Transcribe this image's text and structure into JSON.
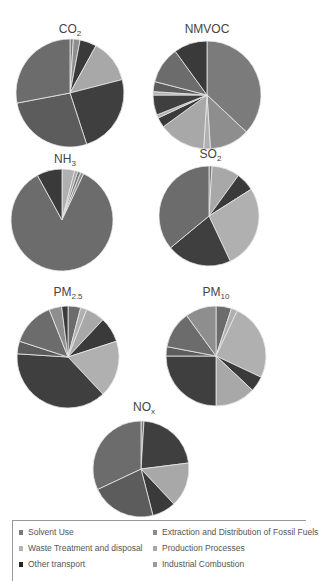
{
  "chart_data": [
    {
      "type": "pie",
      "title": "CO2",
      "title_main": "CO",
      "title_sub": "2",
      "slices": [
        {
          "category": "Solvent Use",
          "value": 1
        },
        {
          "category": "Extraction and Distribution of Fossil Fuels",
          "value": 2
        },
        {
          "category": "Other transport",
          "value": 5
        },
        {
          "category": "Production Processes",
          "value": 13
        },
        {
          "category": "Industrial Combustion",
          "value": 24
        },
        {
          "category": "Road transport",
          "value": 27
        },
        {
          "category": "Energy",
          "value": 28
        }
      ]
    },
    {
      "type": "pie",
      "title": "NMVOC",
      "title_main": "NMVOC",
      "title_sub": "",
      "slices": [
        {
          "category": "Solvent Use",
          "value": 37
        },
        {
          "category": "Extraction and Distribution of Fossil Fuels",
          "value": 12
        },
        {
          "category": "Waste Treatment and disposal",
          "value": 2
        },
        {
          "category": "Production Processes",
          "value": 14
        },
        {
          "category": "Other transport",
          "value": 3
        },
        {
          "category": "Waste Treatment and disposal",
          "value": 1
        },
        {
          "category": "Industrial Combustion",
          "value": 6
        },
        {
          "category": "Waste Treatment and disposal",
          "value": 1
        },
        {
          "category": "Road transport",
          "value": 3
        },
        {
          "category": "Energy",
          "value": 11
        },
        {
          "category": "Other transport",
          "value": 10
        }
      ]
    },
    {
      "type": "pie",
      "title": "NH3",
      "title_main": "NH",
      "title_sub": "3",
      "slices": [
        {
          "category": "Waste Treatment and disposal",
          "value": 4
        },
        {
          "category": "Production Processes",
          "value": 1
        },
        {
          "category": "Solvent Use",
          "value": 1
        },
        {
          "category": "Extraction and Distribution of Fossil Fuels",
          "value": 1
        },
        {
          "category": "Energy",
          "value": 85
        },
        {
          "category": "Other transport",
          "value": 8
        }
      ]
    },
    {
      "type": "pie",
      "title": "SO2",
      "title_main": "SO",
      "title_sub": "2",
      "slices": [
        {
          "category": "Solvent Use",
          "value": 1
        },
        {
          "category": "Production Processes",
          "value": 9
        },
        {
          "category": "Other transport",
          "value": 6
        },
        {
          "category": "Waste Treatment and disposal",
          "value": 27
        },
        {
          "category": "Industrial Combustion",
          "value": 21
        },
        {
          "category": "Energy",
          "value": 36
        }
      ]
    },
    {
      "type": "pie",
      "title": "PM2.5",
      "title_main": "PM",
      "title_sub": "2.5",
      "slices": [
        {
          "category": "Energy",
          "value": 4
        },
        {
          "category": "Waste Treatment and disposal",
          "value": 2
        },
        {
          "category": "Production Processes",
          "value": 6
        },
        {
          "category": "Other transport",
          "value": 8
        },
        {
          "category": "Waste Treatment and disposal",
          "value": 18
        },
        {
          "category": "Industrial Combustion",
          "value": 38
        },
        {
          "category": "Road transport",
          "value": 4
        },
        {
          "category": "Energy",
          "value": 14
        },
        {
          "category": "Extraction and Distribution of Fossil Fuels",
          "value": 4
        },
        {
          "category": "Other transport",
          "value": 2
        }
      ]
    },
    {
      "type": "pie",
      "title": "PM10",
      "title_main": "PM",
      "title_sub": "10",
      "slices": [
        {
          "category": "Energy",
          "value": 5
        },
        {
          "category": "Waste Treatment and disposal",
          "value": 2
        },
        {
          "category": "Waste Treatment and disposal",
          "value": 25
        },
        {
          "category": "Other transport",
          "value": 5
        },
        {
          "category": "Production Processes",
          "value": 13
        },
        {
          "category": "Industrial Combustion",
          "value": 25
        },
        {
          "category": "Road transport",
          "value": 3
        },
        {
          "category": "Energy",
          "value": 12
        },
        {
          "category": "Extraction and Distribution of Fossil Fuels",
          "value": 10
        }
      ]
    },
    {
      "type": "pie",
      "title": "NOx",
      "title_main": "NO",
      "title_sub": "x",
      "slices": [
        {
          "category": "Solvent Use",
          "value": 1
        },
        {
          "category": "Industrial Combustion",
          "value": 22
        },
        {
          "category": "Production Processes",
          "value": 15
        },
        {
          "category": "Other transport",
          "value": 8
        },
        {
          "category": "Road transport",
          "value": 22
        },
        {
          "category": "Energy",
          "value": 32
        }
      ]
    }
  ],
  "legend": {
    "items": [
      {
        "label": "Solvent Use",
        "color": "#7a7a7a"
      },
      {
        "label": "Extraction and Distribution of Fossil Fuels",
        "color": "#8c8c8c"
      },
      {
        "label": "Waste Treatment and disposal",
        "color": "#b4b4b4"
      },
      {
        "label": "Production Processes",
        "color": "#a6a6a6"
      },
      {
        "label": "Other transport",
        "color": "#262626"
      },
      {
        "label": "Industrial Combustion",
        "color": "#9a9a9a"
      }
    ]
  },
  "colors": {
    "Solvent Use": "#7b7b7b",
    "Extraction and Distribution of Fossil Fuels": "#8e8e8e",
    "Waste Treatment and disposal": "#b0b0b0",
    "Production Processes": "#a8a8a8",
    "Other transport": "#3a3a3a",
    "Industrial Combustion": "#3f3f3f",
    "Road transport": "#5c5c5c",
    "Energy": "#6c6c6c"
  }
}
